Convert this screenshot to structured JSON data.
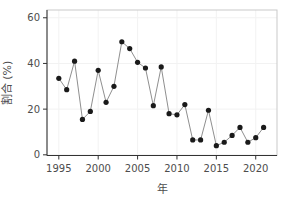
{
  "chart_data": {
    "type": "line",
    "title": "",
    "xlabel": "年",
    "ylabel": "割合 (%)",
    "x": [
      1995,
      1996,
      1997,
      1998,
      1999,
      2000,
      2001,
      2002,
      2003,
      2004,
      2005,
      2006,
      2007,
      2008,
      2009,
      2010,
      2011,
      2012,
      2013,
      2014,
      2015,
      2016,
      2017,
      2018,
      2019,
      2020,
      2021
    ],
    "values": [
      33.5,
      28.5,
      41,
      15.5,
      19,
      37,
      23,
      30,
      49.5,
      46.5,
      40.5,
      38,
      21.5,
      38.5,
      18,
      17.5,
      22,
      6.5,
      6.5,
      19.5,
      4,
      5.5,
      8.5,
      12,
      5.5,
      7.5,
      12
    ],
    "xticks": [
      1995,
      2000,
      2005,
      2010,
      2015,
      2020
    ],
    "yticks": [
      0,
      20,
      40,
      60
    ],
    "xlim": [
      1993.5,
      2022.7
    ],
    "ylim": [
      -0.3,
      63.4
    ],
    "grid": true,
    "legend": "none",
    "marker": "filled-circle",
    "colors": {
      "point": "#1a1a1a",
      "line": "#8f8f8f",
      "axis_line": "#333333",
      "tick": "#333333",
      "tick_label": "#4d4d4d",
      "axis_title": "#4d4d4d",
      "grid": "#f2f2f2",
      "panel_border": "#c9c9c9",
      "background": "#ffffff"
    }
  }
}
